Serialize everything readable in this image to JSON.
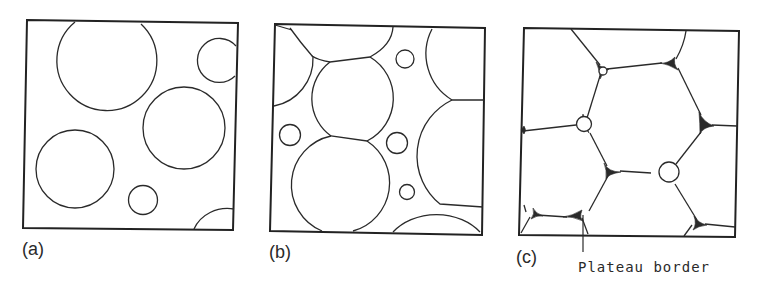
{
  "figure": {
    "panels": [
      {
        "id": "a",
        "label": "(a)",
        "description": "dilute dispersion of spherical bubbles"
      },
      {
        "id": "b",
        "label": "(b)",
        "description": "closely packed, slightly deformed bubbles"
      },
      {
        "id": "c",
        "label": "(c)",
        "description": "polyhedral foam cells with Plateau borders"
      }
    ],
    "annotation": {
      "text": "Plateau border",
      "panel": "c"
    },
    "colors": {
      "line": "#2a2a2a",
      "background": "#ffffff"
    }
  }
}
